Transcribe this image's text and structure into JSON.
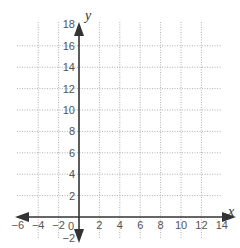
{
  "chart_data": {
    "type": "coordinate-grid",
    "title": "",
    "xlabel": "x",
    "ylabel": "y",
    "xlim": [
      -6,
      14
    ],
    "ylim": [
      -2,
      18
    ],
    "grid": true,
    "grid_step": 2,
    "x_tick_labels": [
      "-6",
      "-4",
      "-2",
      "0",
      "2",
      "4",
      "6",
      "8",
      "10",
      "12",
      "14"
    ],
    "y_tick_labels": [
      "-2",
      "2",
      "4",
      "6",
      "8",
      "10",
      "12",
      "14",
      "16",
      "18"
    ],
    "origin_label": "0",
    "series": []
  },
  "colors": {
    "axis": "#333333",
    "grid": "#9a9a9a",
    "tick_text": "#555555"
  }
}
